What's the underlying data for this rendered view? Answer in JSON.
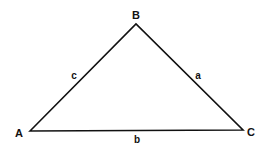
{
  "diagram": {
    "type": "triangle",
    "stroke_color": "#111111",
    "background": "#ffffff",
    "vertices": [
      {
        "label": "A",
        "x": 30,
        "y": 131
      },
      {
        "label": "B",
        "x": 136,
        "y": 24
      },
      {
        "label": "C",
        "x": 243,
        "y": 130
      }
    ],
    "sides": [
      {
        "label": "a",
        "between": "B-C"
      },
      {
        "label": "b",
        "between": "A-C"
      },
      {
        "label": "c",
        "between": "A-B"
      }
    ]
  }
}
